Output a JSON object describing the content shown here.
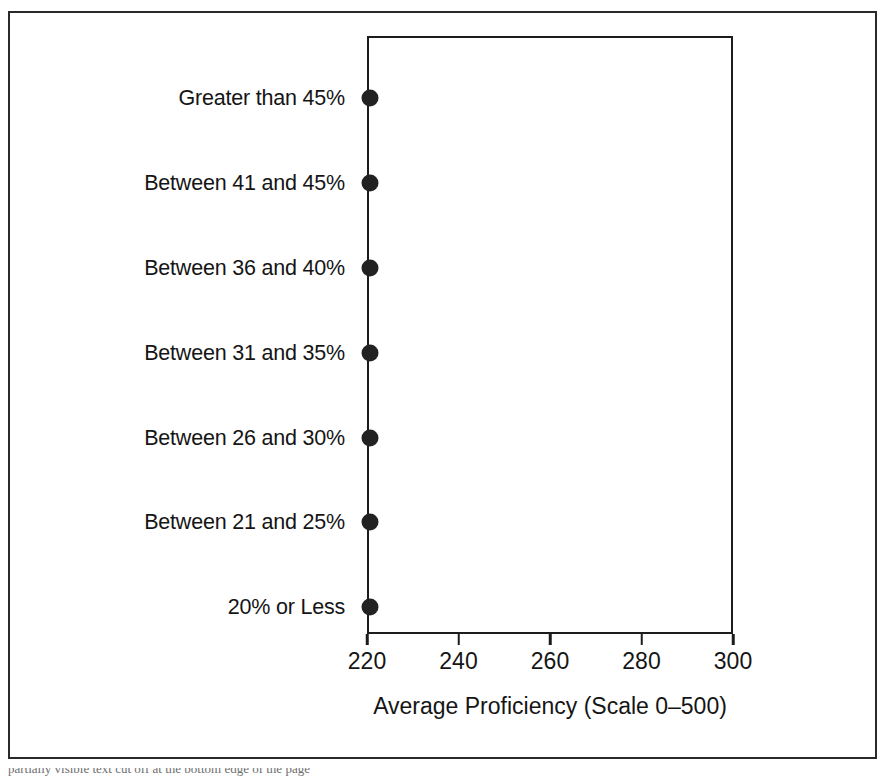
{
  "chart_data": {
    "type": "scatter",
    "subtype": "lollipop-dot-plot",
    "title": "",
    "xlabel": "Average Proficiency (Scale 0–500)",
    "ylabel": "",
    "xlim": [
      220,
      300
    ],
    "xticks": [
      220,
      240,
      260,
      280,
      300
    ],
    "xtick_labels": [
      "220",
      "240",
      "260",
      "280",
      "300"
    ],
    "grid": false,
    "legend": null,
    "orientation": "horizontal",
    "baseline": 220,
    "categories": [
      "Greater than 45%",
      "Between 41 and 45%",
      "Between 36 and 40%",
      "Between 31 and 35%",
      "Between 26 and 30%",
      "Between 21 and 25%",
      "20% or Less"
    ],
    "values": [
      241,
      251.5,
      251.5,
      253.5,
      252.5,
      263.5,
      276.5
    ],
    "marker": {
      "shape": "circle",
      "color": "#222222",
      "size_px": 17
    },
    "line": {
      "color": "#1f1f1f",
      "width_px": 2.8
    }
  },
  "figure": {
    "border_color": "#2a2a2a",
    "panel_border_color": "#1c1c1c",
    "background": "#ffffff",
    "text_color": "#151515"
  },
  "caption": {
    "clipped_text": "partially visible text cut off at the bottom edge of the page"
  }
}
